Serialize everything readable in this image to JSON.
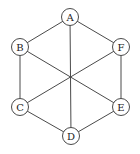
{
  "diagram": {
    "type": "graph",
    "nodes": [
      {
        "id": "A",
        "label": "A",
        "x": 70,
        "y": 17
      },
      {
        "id": "B",
        "label": "B",
        "x": 20,
        "y": 47
      },
      {
        "id": "C",
        "label": "C",
        "x": 20,
        "y": 107
      },
      {
        "id": "D",
        "label": "D",
        "x": 71,
        "y": 136
      },
      {
        "id": "E",
        "label": "E",
        "x": 121,
        "y": 107
      },
      {
        "id": "F",
        "label": "F",
        "x": 121,
        "y": 47
      }
    ],
    "edges": [
      [
        "A",
        "B"
      ],
      [
        "A",
        "F"
      ],
      [
        "B",
        "C"
      ],
      [
        "F",
        "E"
      ],
      [
        "C",
        "D"
      ],
      [
        "E",
        "D"
      ],
      [
        "A",
        "D"
      ],
      [
        "B",
        "E"
      ],
      [
        "F",
        "C"
      ]
    ],
    "node_radius": 8.5,
    "colors": {
      "stroke": "#4a4a4a",
      "text": "#222222",
      "background": "#ffffff"
    }
  }
}
